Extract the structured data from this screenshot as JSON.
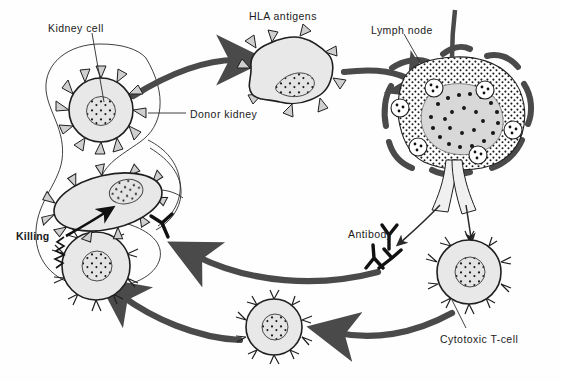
{
  "figure": {
    "type": "biology-process-diagram",
    "width": 561,
    "height": 382,
    "background": "#ffffff"
  },
  "colors": {
    "flow_arrow": "#4a4a4a",
    "cell_fill": "#e8e8e8",
    "nucleus_fill": "#8f8f8f",
    "outline": "#1f1f1f",
    "text": "#1b1b1b",
    "lymph_capsule": "#4a4a4a",
    "antibody": "#111111"
  },
  "labels": [
    {
      "id": "kidney-cell",
      "text": "Kidney cell",
      "x": 48,
      "y": 22,
      "bold": false
    },
    {
      "id": "hla-antigens",
      "text": "HLA antigens",
      "x": 249,
      "y": 10,
      "bold": false
    },
    {
      "id": "lymph-node",
      "text": "Lymph node",
      "x": 371,
      "y": 24,
      "bold": false
    },
    {
      "id": "donor-kidney",
      "text": "Donor kidney",
      "x": 190,
      "y": 108,
      "bold": false
    },
    {
      "id": "antibody",
      "text": "Antibody",
      "x": 348,
      "y": 228,
      "bold": false
    },
    {
      "id": "killing",
      "text": "Killing",
      "x": 16,
      "y": 230,
      "bold": true
    },
    {
      "id": "cytotoxic-tcell",
      "text": "Cytotoxic T-cell",
      "x": 440,
      "y": 333,
      "bold": false
    }
  ],
  "structures": [
    {
      "id": "donor-kidney-outline",
      "kind": "kidney-bean-outline",
      "note": "thin S-curved outline enclosing kidney cell and killing scene"
    },
    {
      "id": "kidney-cell",
      "kind": "spiked-round-cell",
      "cx": 101,
      "cy": 110,
      "r": 32,
      "spikes": 12,
      "nucleus_r": 14
    },
    {
      "id": "antigen-presenting-cell",
      "kind": "irregular-spiked-cell",
      "cx": 293,
      "cy": 68,
      "note": "bean-shaped nucleus"
    },
    {
      "id": "lymph-node",
      "kind": "lymph-node",
      "cx": 462,
      "cy": 110,
      "germinal_centers": 6,
      "note": "stippled cortex, dark capsule lobes, afferent and efferent vessels"
    },
    {
      "id": "cytotoxic-tcell",
      "kind": "spiked-round-cell",
      "cx": 469,
      "cy": 272,
      "r": 32,
      "spikes": 12,
      "nucleus_r": 15
    },
    {
      "id": "circulating-cell",
      "kind": "spiked-round-cell",
      "cx": 274,
      "cy": 327,
      "r": 28,
      "spikes": 12,
      "nucleus_r": 13
    },
    {
      "id": "effector-tcell",
      "kind": "spiked-ellipse-cell",
      "cx": 108,
      "cy": 202,
      "rx": 55,
      "ry": 27,
      "note": "tilted lytic T-cell with zig-zag lysis arrow"
    },
    {
      "id": "target-kidney-cell",
      "kind": "spiked-round-cell",
      "cx": 96,
      "cy": 266,
      "r": 34,
      "spikes": 12,
      "nucleus_r": 15
    },
    {
      "id": "antibody-cluster",
      "kind": "y-shapes",
      "count": 3,
      "x": 372,
      "y": 240
    },
    {
      "id": "bound-antibody",
      "kind": "y-shape-inverted",
      "x": 157,
      "y": 225
    }
  ],
  "flow": [
    {
      "id": "arrow-kidney-to-antigen",
      "from": "kidney-cell",
      "to": "antigen-presenting-cell",
      "style": "thick-curved"
    },
    {
      "id": "arrow-antigen-to-lymph",
      "from": "antigen-presenting-cell",
      "to": "lymph-node",
      "style": "thick-curved"
    },
    {
      "id": "arrow-lymph-to-antibody",
      "from": "lymph-node",
      "to": "antibody-cluster",
      "style": "thin-curved"
    },
    {
      "id": "arrow-lymph-to-tcell",
      "from": "lymph-node",
      "to": "cytotoxic-tcell",
      "style": "thin-curved"
    },
    {
      "id": "arrow-tcell-to-circulating",
      "from": "cytotoxic-tcell",
      "to": "circulating-cell",
      "style": "thick-curved"
    },
    {
      "id": "arrow-circulating-to-target",
      "from": "circulating-cell",
      "to": "target-kidney-cell",
      "style": "thick-curved"
    },
    {
      "id": "arrow-antibody-to-target",
      "from": "antibody-cluster",
      "to": "bound-antibody",
      "style": "thick-curved"
    }
  ]
}
